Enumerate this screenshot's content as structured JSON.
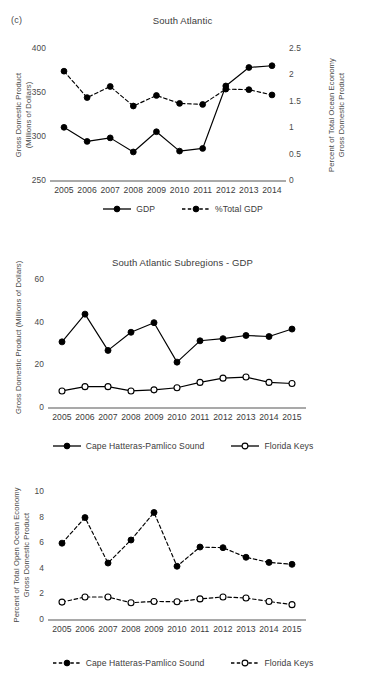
{
  "figure": {
    "panel_letter": "(c)"
  },
  "chart_data": [
    {
      "id": "south-atlantic-gdp",
      "type": "line",
      "title": "South Atlantic",
      "xlabel": "",
      "ylabel": "Gross Domestic Product (Millions of Dollars)",
      "ylabel_lines": [
        "Gross Domestic Product",
        "(Millions of Dollars)"
      ],
      "y2label": "Percent of Total Ocean Economy Gross Domestic Product",
      "y2label_lines": [
        "Percent of Total Ocean Economy",
        "Gross Domestic Product"
      ],
      "categories": [
        "2005",
        "2006",
        "2007",
        "2008",
        "2009",
        "2010",
        "2011",
        "2012",
        "2013",
        "2014"
      ],
      "ylim": [
        250,
        400
      ],
      "yticks": [
        "250",
        "300",
        "350",
        "400"
      ],
      "ytick_values": [
        250,
        300,
        350,
        400
      ],
      "y2lim": [
        0,
        2.5
      ],
      "y2ticks": [
        "0",
        "0.5",
        "1",
        "1.5",
        "2",
        "2.5"
      ],
      "y2tick_values": [
        0,
        0.5,
        1,
        1.5,
        2,
        2.5
      ],
      "grid": false,
      "legend_position": "bottom",
      "series": [
        {
          "name": "GDP",
          "axis": "left",
          "style": "solid",
          "marker": "filled-circle",
          "values": [
            311,
            295,
            299,
            283,
            306,
            284,
            287,
            358,
            379,
            381
          ]
        },
        {
          "name": "%Total GDP",
          "axis": "right",
          "style": "dashed",
          "marker": "filled-circle",
          "values": [
            2.08,
            1.58,
            1.79,
            1.42,
            1.62,
            1.47,
            1.45,
            1.74,
            1.73,
            1.63
          ]
        }
      ]
    },
    {
      "id": "south-atlantic-subregions-gdp",
      "type": "line",
      "title": "South Atlantic Subregions - GDP",
      "xlabel": "",
      "ylabel": "Gross Domestic Product (Millions of Dollars)",
      "ylabel_lines": [
        "Gross Domestic Product (Millions of Dollars)"
      ],
      "categories": [
        "2005",
        "2006",
        "2007",
        "2008",
        "2009",
        "2010",
        "2011",
        "2012",
        "2013",
        "2014",
        "2015"
      ],
      "ylim": [
        0,
        60
      ],
      "yticks": [
        "0",
        "20",
        "40",
        "60"
      ],
      "ytick_values": [
        0,
        20,
        40,
        60
      ],
      "grid": false,
      "legend_position": "bottom",
      "series": [
        {
          "name": "Cape Hatteras-Pamlico Sound",
          "style": "solid",
          "marker": "filled-circle",
          "values": [
            31,
            44,
            27,
            35.5,
            40,
            21.5,
            31.5,
            32.5,
            34,
            33.5,
            37
          ]
        },
        {
          "name": "Florida Keys",
          "style": "solid",
          "marker": "open-circle",
          "values": [
            8,
            10,
            10,
            8,
            8.5,
            9.5,
            12,
            14,
            14.5,
            12,
            11.5
          ]
        }
      ]
    },
    {
      "id": "south-atlantic-subregions-percent",
      "type": "line",
      "title": "",
      "xlabel": "",
      "ylabel": "Percent of Total Open Ocean Economy Gross Domestic Product",
      "ylabel_lines": [
        "Percent of Total Open Ocean Economy",
        "Gross Domestic Product"
      ],
      "categories": [
        "2005",
        "2006",
        "2007",
        "2008",
        "2009",
        "2010",
        "2011",
        "2012",
        "2013",
        "2014",
        "2015"
      ],
      "ylim": [
        0,
        10
      ],
      "yticks": [
        "0",
        "2",
        "4",
        "6",
        "8",
        "10"
      ],
      "ytick_values": [
        0,
        2,
        4,
        6,
        8,
        10
      ],
      "grid": false,
      "legend_position": "bottom",
      "series": [
        {
          "name": "Cape Hatteras-Pamlico Sound",
          "style": "dashed",
          "marker": "filled-circle",
          "values": [
            6.0,
            8.0,
            4.45,
            6.25,
            8.4,
            4.2,
            5.7,
            5.65,
            4.9,
            4.5,
            4.35
          ]
        },
        {
          "name": "Florida Keys",
          "style": "dashed",
          "marker": "open-circle",
          "values": [
            1.4,
            1.8,
            1.8,
            1.35,
            1.45,
            1.42,
            1.65,
            1.8,
            1.72,
            1.45,
            1.2
          ]
        }
      ]
    }
  ],
  "colors": {
    "line": "#000000",
    "axis": "#8c8c8c",
    "text": "#3b3b3b",
    "tick_text": "#4a4a4a",
    "background": "#ffffff"
  }
}
